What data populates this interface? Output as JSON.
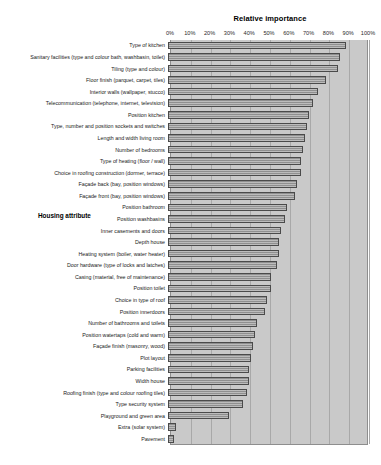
{
  "chart_data": {
    "type": "bar",
    "orientation": "horizontal",
    "title": "Relative importance",
    "xlabel": "",
    "ylabel": "Housing attribute",
    "xlim": [
      0,
      100
    ],
    "xtick_labels": [
      "0%",
      "10%",
      "20%",
      "30%",
      "40%",
      "50%",
      "60%",
      "70%",
      "80%",
      "90%",
      "100%"
    ],
    "xtick_values": [
      0,
      10,
      20,
      30,
      40,
      50,
      60,
      70,
      80,
      90,
      100
    ],
    "grid": true,
    "legend": null,
    "categories": [
      "Type of kitchen",
      "Sanitary facilities (type and colour bath, washbasin, toilet)",
      "Tiling (type and colour)",
      "Floor finish (parquet, carpet, tiles)",
      "Interior walls (wallpaper, stucco)",
      "Telecommunication (telephone, internet, television)",
      "Position kitchen",
      "Type, number and position sockets and switches",
      "Length and width living room",
      "Number of bedrooms",
      "Type of heating (floor / wall)",
      "Choice in roofing construction (dormer, terrace)",
      "Façade back (bay, position windows)",
      "Façade front (bay, position windows)",
      "Position bathroom",
      "Position washbasins",
      "Inner casements and doors",
      "Depth house",
      "Heating system (boiler, water heater)",
      "Door hardware (type of locks and latches)",
      "Casing (material, free of maintenance)",
      "Position toilet",
      "Choice in type of roof",
      "Position innerdoors",
      "Number of bathrooms and toilets",
      "Position watertaps (cold and warm)",
      "Façade finish (masonry, wood)",
      "Plot layout",
      "Parking facilities",
      "Width house",
      "Roofing finish (type and colour roofing tiles)",
      "Type security system",
      "Playground and green area",
      "Extra (solar system)",
      "Pavement"
    ],
    "values": [
      90,
      87,
      86,
      80,
      76,
      73,
      71,
      70,
      69,
      68,
      67,
      67,
      65,
      64,
      60,
      59,
      57,
      56,
      56,
      55,
      52,
      52,
      50,
      49,
      45,
      44,
      43,
      42,
      41,
      41,
      40,
      38,
      31,
      4,
      3
    ]
  }
}
